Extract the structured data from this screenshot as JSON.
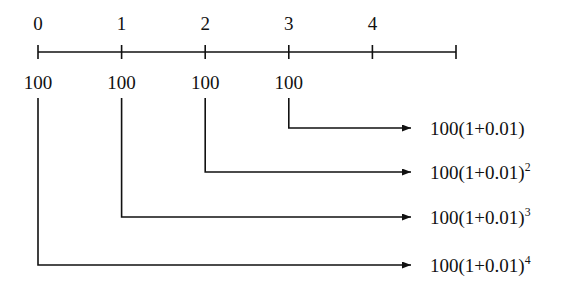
{
  "figure": {
    "background_color": "#ffffff",
    "stroke_color": "#111111"
  },
  "axis": {
    "name": "time-axis",
    "y": 52,
    "x_start": 38,
    "x_end": 456,
    "tick_spacing": 83.6,
    "tick_half_height": 7,
    "ticks": [
      {
        "label": "0",
        "x": 38
      },
      {
        "label": "1",
        "x": 121.6
      },
      {
        "label": "2",
        "x": 205.2
      },
      {
        "label": "3",
        "x": 288.8
      },
      {
        "label": "4",
        "x": 372.4
      },
      {
        "label": "",
        "x": 456
      }
    ],
    "tick_label_y": 33
  },
  "principals": {
    "label_y": 92,
    "items": [
      {
        "text": "100",
        "x": 38
      },
      {
        "text": "100",
        "x": 121.6
      },
      {
        "text": "100",
        "x": 205.2
      },
      {
        "text": "100",
        "x": 288.8
      }
    ]
  },
  "arrows": {
    "vertical_start_y": 98,
    "head_x": 420,
    "label_x": 430,
    "items": [
      {
        "name": "arrow-period-1",
        "start_x": 288.8,
        "row_y": 128,
        "base": "100(1+0.01)",
        "exponent": ""
      },
      {
        "name": "arrow-period-2",
        "start_x": 205.2,
        "row_y": 172,
        "base": "100(1+0.01)",
        "exponent": "2"
      },
      {
        "name": "arrow-period-3",
        "start_x": 121.6,
        "row_y": 217,
        "base": "100(1+0.01)",
        "exponent": "3"
      },
      {
        "name": "arrow-period-4",
        "start_x": 38,
        "row_y": 265,
        "base": "100(1+0.01)",
        "exponent": "4"
      }
    ]
  }
}
